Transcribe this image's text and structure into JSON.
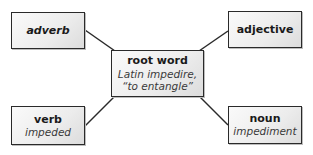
{
  "diagram": {
    "type": "word-map",
    "center": {
      "title": "root word",
      "line1": "Latin impedire,",
      "line2": "“to entangle”"
    },
    "nodes": {
      "adverb": {
        "title": "adverb",
        "value": ""
      },
      "adjective": {
        "title": "adjective",
        "value": ""
      },
      "verb": {
        "title": "verb",
        "value": "impeded"
      },
      "noun": {
        "title": "noun",
        "value": "impediment"
      }
    },
    "edges": [
      {
        "from": "adverb",
        "to": "root word"
      },
      {
        "from": "adjective",
        "to": "root word"
      },
      {
        "from": "verb",
        "to": "root word"
      },
      {
        "from": "noun",
        "to": "root word"
      }
    ],
    "colors": {
      "border": "#2a2a2a",
      "fill_light": "#fafafa",
      "fill_dark": "#dcdcdc",
      "text": "#1a1a1a",
      "connector": "#2a2a2a"
    }
  }
}
